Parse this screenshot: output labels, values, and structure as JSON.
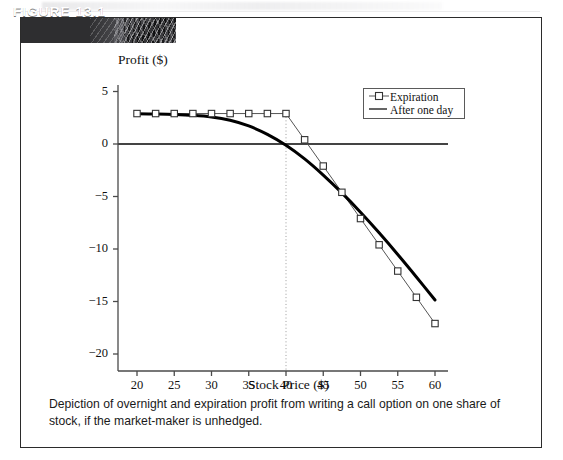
{
  "figure": {
    "banner_label": "FIGURE 13.1",
    "caption": "Depiction of overnight and expiration profit from writing a call option on one share of stock, if the market-maker is unhedged."
  },
  "legend": {
    "position": "inside-top-right",
    "entries": [
      {
        "label": "Expiration",
        "symbol": "line-with-square-marker",
        "color": "#555555"
      },
      {
        "label": "After one day",
        "symbol": "solid-thick-line",
        "color": "#000000"
      }
    ]
  },
  "chart_data": {
    "type": "line",
    "title": "",
    "xlabel": "Stock Price ($)",
    "ylabel": "Profit ($)",
    "xlim": [
      18,
      62
    ],
    "ylim": [
      -21,
      6
    ],
    "xticks": [
      20,
      25,
      30,
      35,
      40,
      45,
      50,
      55,
      60
    ],
    "yticks": [
      5,
      0,
      -5,
      -10,
      -15,
      -20
    ],
    "ytick_labels": [
      "5",
      "0",
      "−5",
      "−10",
      "−15",
      "−20"
    ],
    "grid": false,
    "zero_line": true,
    "annotations": [
      {
        "type": "vertical-dotted-line",
        "x": 40,
        "label": "strike",
        "from_y": 2.9,
        "to_y": -21
      }
    ],
    "x": [
      20,
      22.5,
      25,
      27.5,
      30,
      32.5,
      35,
      37.5,
      40,
      42.5,
      45,
      47.5,
      50,
      52.5,
      55,
      57.5,
      60
    ],
    "series": [
      {
        "name": "Expiration",
        "marker": "square",
        "linewidth": 1,
        "color": "#555555",
        "values": [
          2.9,
          2.9,
          2.9,
          2.9,
          2.9,
          2.9,
          2.9,
          2.9,
          2.9,
          0.4,
          -2.1,
          -4.6,
          -7.1,
          -9.6,
          -12.1,
          -14.6,
          -17.1
        ]
      },
      {
        "name": "After one day",
        "marker": "none",
        "linewidth": 3,
        "color": "#000000",
        "values": [
          2.88,
          2.86,
          2.82,
          2.74,
          2.58,
          2.26,
          1.72,
          0.92,
          -0.12,
          -1.42,
          -2.96,
          -4.66,
          -6.5,
          -8.46,
          -10.52,
          -12.66,
          -14.86
        ]
      }
    ]
  }
}
